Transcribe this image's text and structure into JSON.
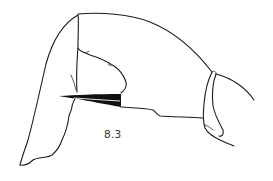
{
  "figure": {
    "label": "8.3",
    "colors": {
      "background": "#ffffff",
      "ink": "#1c1c1c",
      "fill_dark": "#111111"
    }
  }
}
